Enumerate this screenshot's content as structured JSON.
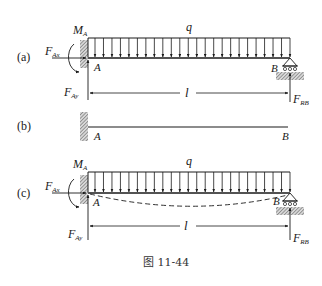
{
  "figure": {
    "caption": "图 11-44",
    "panels": [
      {
        "id": "a",
        "tag": "(a)",
        "labels": {
          "moment": "M",
          "moment_sub": "A",
          "load": "q",
          "fax": "F",
          "fax_sub": "Ax",
          "fay": "F",
          "fay_sub": "Ay",
          "frb": "F",
          "frb_sub": "RB",
          "point_a": "A",
          "point_b": "B",
          "length": "l"
        }
      },
      {
        "id": "b",
        "tag": "(b)",
        "labels": {
          "point_a": "A",
          "point_b": "B"
        }
      },
      {
        "id": "c",
        "tag": "(c)",
        "labels": {
          "moment": "M",
          "moment_sub": "A",
          "load": "q",
          "fax": "F",
          "fax_sub": "Ax",
          "fay": "F",
          "fay_sub": "Ay",
          "frb": "F",
          "frb_sub": "RB",
          "point_a": "A",
          "point_b": "B",
          "length": "l"
        }
      }
    ]
  }
}
